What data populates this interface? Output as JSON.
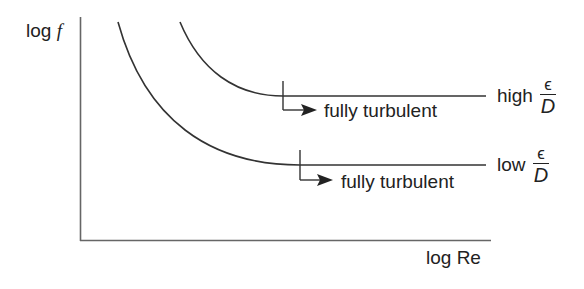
{
  "diagram": {
    "y_axis_label_prefix": "log ",
    "y_axis_label_var": "f",
    "x_axis_label": "log Re",
    "curves": [
      {
        "id": "high",
        "label_word": "high",
        "label_num": "ϵ",
        "label_den": "D",
        "annotation": "fully turbulent"
      },
      {
        "id": "low",
        "label_word": "low",
        "label_num": "ϵ",
        "label_den": "D",
        "annotation": "fully turbulent"
      }
    ],
    "colors": {
      "axis": "#666666",
      "curve": "#333333",
      "text": "#222222"
    }
  }
}
